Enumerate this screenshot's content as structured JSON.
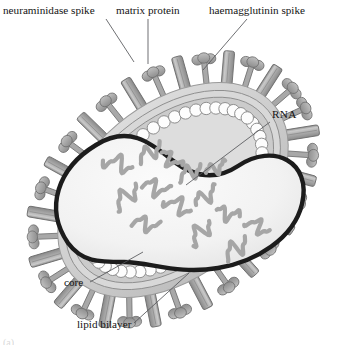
{
  "figure": {
    "background_color": "#ffffff",
    "corner_mark": "(a)"
  },
  "labels": [
    {
      "id": "neuraminidase-spike",
      "text": "neuraminidase spike",
      "x": 3,
      "y": 14,
      "anchor": "start",
      "leader": "M 106 19 L 134 62"
    },
    {
      "id": "matrix-protein",
      "text": "matrix protein",
      "x": 116,
      "y": 14,
      "anchor": "start",
      "leader": "M 148 19 L 148 64"
    },
    {
      "id": "haemagglutinin-spike",
      "text": "haemagglutinin spike",
      "x": 209,
      "y": 14,
      "anchor": "start",
      "leader": "M 247 19 L 203 70"
    },
    {
      "id": "rna",
      "text": "RNA",
      "x": 272,
      "y": 118,
      "anchor": "start",
      "leader": "M 270 122 L 186 185"
    },
    {
      "id": "core",
      "text": "core",
      "x": 64,
      "y": 286,
      "anchor": "start",
      "leader": "M 90 282 L 143 252"
    },
    {
      "id": "lipid-bilayer",
      "text": "lipid bilayer",
      "x": 77,
      "y": 328,
      "anchor": "start",
      "leader": "M 134 323 L 189 273"
    }
  ],
  "colors": {
    "envelope_outer": "#d5d5d5",
    "envelope_mid": "#c2c2c2",
    "envelope_inner": "#cfcfcf",
    "envelope_line": "#8d8d8d",
    "core_outline": "#1c1c1c",
    "core_fill": "#f2f2f2",
    "matrix_fill": "#fdfdfd",
    "matrix_stroke": "#8f8f8f",
    "rna_color": "#a6a6a6",
    "spike_na_fill": "#a8a8a8",
    "spike_ha_fill": "#b4b4b4",
    "spike_stroke": "#6f6f6f",
    "leader_line": "#55565a",
    "text": "#141414"
  },
  "structure": {
    "virion_shape": "elongated peanut/oval cross-section tilted about -40 degrees",
    "envelope_layers": 3,
    "matrix_protein_beads": 52,
    "rna_segments": 14,
    "neuraminidase_spike_count": 17,
    "haemagglutinin_spike_count": 16
  },
  "geometry": {
    "center_x": 173,
    "center_y": 190,
    "rx": 132,
    "ry": 86,
    "rotation_deg": -40
  }
}
